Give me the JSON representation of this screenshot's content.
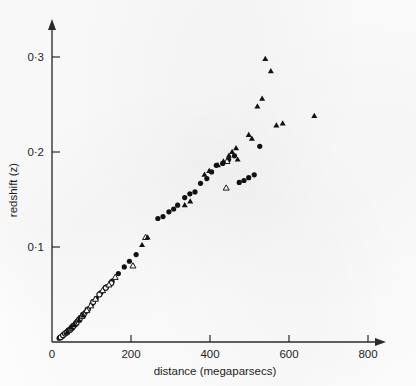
{
  "chart_data": {
    "type": "scatter",
    "title": "",
    "xlabel": "distance (megaparsecs)",
    "ylabel": "redshift (z)",
    "xlim": [
      0,
      820
    ],
    "ylim": [
      0,
      0.325
    ],
    "xticks": [
      0,
      200,
      400,
      600,
      800
    ],
    "xtick_labels": [
      "0",
      "200",
      "400",
      "600",
      "800"
    ],
    "yticks": [
      0.1,
      0.2,
      0.3
    ],
    "ytick_labels": [
      "0·1",
      "0·2",
      "0·3"
    ],
    "grid": false,
    "legend": "none",
    "axis_style": "two-spine-with-arrowheads",
    "series": [
      {
        "name": "filled-circle",
        "marker": "filled-circle",
        "color": "#111111",
        "points": [
          [
            18,
            0.004
          ],
          [
            26,
            0.006
          ],
          [
            30,
            0.008
          ],
          [
            34,
            0.009
          ],
          [
            38,
            0.011
          ],
          [
            41,
            0.012
          ],
          [
            44,
            0.013
          ],
          [
            47,
            0.014
          ],
          [
            50,
            0.016
          ],
          [
            53,
            0.017
          ],
          [
            56,
            0.018
          ],
          [
            60,
            0.02
          ],
          [
            64,
            0.022
          ],
          [
            68,
            0.024
          ],
          [
            72,
            0.026
          ],
          [
            78,
            0.029
          ],
          [
            84,
            0.031
          ],
          [
            92,
            0.035
          ],
          [
            101,
            0.04
          ],
          [
            112,
            0.046
          ],
          [
            124,
            0.052
          ],
          [
            138,
            0.058
          ],
          [
            152,
            0.064
          ],
          [
            168,
            0.072
          ],
          [
            183,
            0.079
          ],
          [
            196,
            0.085
          ],
          [
            213,
            0.092
          ],
          [
            268,
            0.13
          ],
          [
            281,
            0.132
          ],
          [
            296,
            0.137
          ],
          [
            308,
            0.14
          ],
          [
            318,
            0.144
          ],
          [
            336,
            0.152
          ],
          [
            349,
            0.156
          ],
          [
            362,
            0.158
          ],
          [
            376,
            0.167
          ],
          [
            392,
            0.172
          ],
          [
            404,
            0.179
          ],
          [
            416,
            0.186
          ],
          [
            432,
            0.188
          ],
          [
            447,
            0.192
          ],
          [
            462,
            0.196
          ],
          [
            474,
            0.168
          ],
          [
            486,
            0.17
          ],
          [
            498,
            0.173
          ],
          [
            512,
            0.176
          ],
          [
            526,
            0.206
          ]
        ]
      },
      {
        "name": "open-circle",
        "marker": "open-circle",
        "color": "#141414",
        "points": [
          [
            22,
            0.005
          ],
          [
            28,
            0.007
          ],
          [
            33,
            0.009
          ],
          [
            37,
            0.01
          ],
          [
            42,
            0.012
          ],
          [
            46,
            0.013
          ],
          [
            51,
            0.015
          ],
          [
            55,
            0.017
          ],
          [
            62,
            0.02
          ],
          [
            70,
            0.024
          ],
          [
            80,
            0.029
          ],
          [
            90,
            0.034
          ],
          [
            104,
            0.042
          ],
          [
            120,
            0.05
          ],
          [
            136,
            0.057
          ],
          [
            150,
            0.062
          ]
        ]
      },
      {
        "name": "open-triangle",
        "marker": "open-triangle",
        "color": "#141414",
        "points": [
          [
            46,
            0.014
          ],
          [
            58,
            0.019
          ],
          [
            66,
            0.023
          ],
          [
            76,
            0.027
          ],
          [
            88,
            0.033
          ],
          [
            98,
            0.038
          ],
          [
            110,
            0.045
          ],
          [
            128,
            0.054
          ],
          [
            144,
            0.06
          ],
          [
            160,
            0.068
          ],
          [
            205,
            0.08
          ],
          [
            237,
            0.11
          ],
          [
            443,
            0.19
          ],
          [
            441,
            0.162
          ]
        ]
      },
      {
        "name": "filled-triangle",
        "marker": "filled-triangle",
        "color": "#111111",
        "points": [
          [
            38,
            0.01
          ],
          [
            48,
            0.015
          ],
          [
            57,
            0.018
          ],
          [
            68,
            0.023
          ],
          [
            79,
            0.028
          ],
          [
            228,
            0.102
          ],
          [
            242,
            0.11
          ],
          [
            336,
            0.144
          ],
          [
            350,
            0.148
          ],
          [
            386,
            0.176
          ],
          [
            398,
            0.18
          ],
          [
            420,
            0.186
          ],
          [
            434,
            0.19
          ],
          [
            448,
            0.196
          ],
          [
            456,
            0.2
          ],
          [
            466,
            0.204
          ],
          [
            470,
            0.192
          ],
          [
            498,
            0.218
          ],
          [
            506,
            0.214
          ],
          [
            520,
            0.248
          ],
          [
            532,
            0.256
          ],
          [
            540,
            0.298
          ],
          [
            554,
            0.285
          ],
          [
            568,
            0.228
          ],
          [
            584,
            0.23
          ],
          [
            664,
            0.238
          ]
        ]
      }
    ]
  },
  "axes": {
    "x_label": "distance (megaparsecs)",
    "y_label": "redshift (z)"
  }
}
